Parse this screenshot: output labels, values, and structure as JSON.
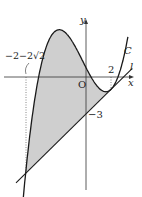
{
  "diagram": {
    "type": "function-graph",
    "curve_label": "C",
    "line_label": "l",
    "x_axis_label": "x",
    "y_axis_label": "y",
    "origin_label": "O",
    "x_tick_2": "2",
    "x_tick_left": "−2−2√2",
    "y_tick": "−3",
    "fill_color": "#cfcfcf",
    "stroke_color": "#1a1a1a"
  }
}
